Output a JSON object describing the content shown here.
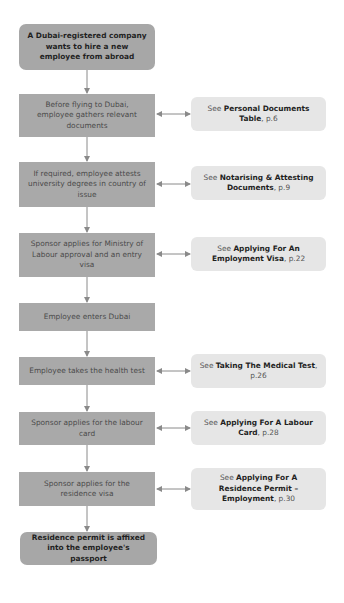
{
  "colors": {
    "step_fill": "#a9a9a9",
    "terminal_fill": "#a7a7a7",
    "reference_fill": "#e6e6e6",
    "connector": "#8a8a8a"
  },
  "flowchart": {
    "start": {
      "text": "A Dubai-registered company wants to hire a new employee from abroad"
    },
    "steps": [
      {
        "text": "Before flying to Dubai, employee gathers relevant documents",
        "reference": {
          "prefix": "See ",
          "title": "Personal Documents Table",
          "page": ", p.6"
        }
      },
      {
        "text": "If required, employee attests university degrees in country of issue",
        "reference": {
          "prefix": "See ",
          "title": "Notarising & Attesting Documents",
          "page": ", p.9"
        }
      },
      {
        "text": "Sponsor applies for Ministry of Labour approval and an entry visa",
        "reference": {
          "prefix": "See ",
          "title": "Applying For An Employment Visa",
          "page": ", p.22"
        }
      },
      {
        "text": "Employee enters Dubai",
        "reference": null
      },
      {
        "text": "Employee takes the health test",
        "reference": {
          "prefix": "See ",
          "title": "Taking The Medical Test",
          "page": ", p.26"
        }
      },
      {
        "text": "Sponsor applies for the labour card",
        "reference": {
          "prefix": "See ",
          "title": "Applying For A Labour Card",
          "page": ", p.28"
        }
      },
      {
        "text": "Sponsor applies for the residence visa",
        "reference": {
          "prefix": "See ",
          "title": "Applying For A Residence Permit – Employment",
          "page": ", p.30"
        }
      }
    ],
    "end": {
      "text": "Residence permit is affixed into the employee's passport"
    }
  }
}
